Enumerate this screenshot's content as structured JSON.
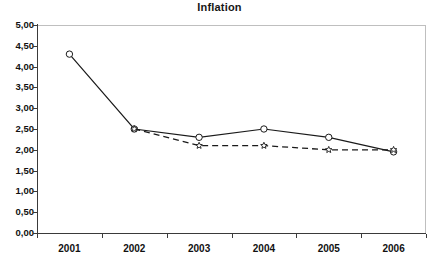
{
  "chart_data": {
    "type": "line",
    "title": "Inflation",
    "xlabel": "",
    "ylabel": "",
    "categories": [
      "2001",
      "2002",
      "2003",
      "2004",
      "2005",
      "2006"
    ],
    "x_tick_labels": [
      "2001",
      "2002",
      "2003",
      "2004",
      "2005",
      "2006"
    ],
    "y_tick_labels": [
      "0,00",
      "0,50",
      "1,00",
      "1,50",
      "2,00",
      "2,50",
      "3,00",
      "3,50",
      "4,00",
      "4,50",
      "5,00"
    ],
    "y_tick_values": [
      0,
      0.5,
      1,
      1.5,
      2,
      2.5,
      3,
      3.5,
      4,
      4.5,
      5
    ],
    "ylim": [
      0,
      5
    ],
    "grid": false,
    "legend": "none",
    "decimal_separator": ",",
    "series": [
      {
        "name": "series-solid-circle",
        "line_style": "solid",
        "marker": "circle-open",
        "color": "#1a1a1a",
        "x": [
          "2001",
          "2002",
          "2003",
          "2004",
          "2005",
          "2006"
        ],
        "values": [
          4.3,
          2.5,
          2.3,
          2.5,
          2.3,
          1.95
        ]
      },
      {
        "name": "series-dashed-star",
        "line_style": "dashed",
        "marker": "star-open",
        "color": "#1a1a1a",
        "x": [
          "2002",
          "2003",
          "2004",
          "2005",
          "2006"
        ],
        "values": [
          2.5,
          2.1,
          2.1,
          2.0,
          2.0
        ]
      }
    ]
  },
  "colors": {
    "axis": "#3a3a3a",
    "plot_border": "#bfbfbf",
    "text": "#111111",
    "background": "#ffffff"
  }
}
